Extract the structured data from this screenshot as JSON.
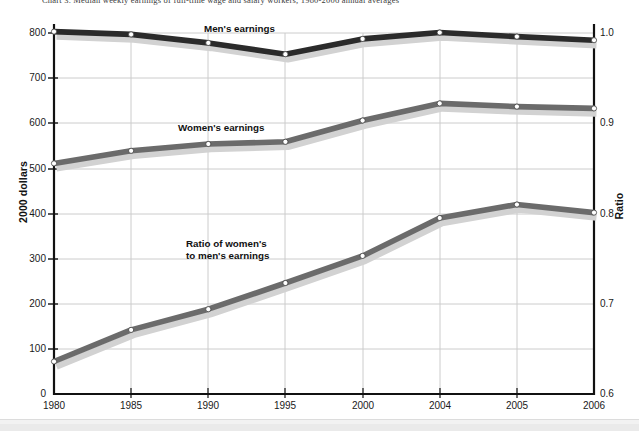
{
  "figure": {
    "title": "Chart 3.  Median weekly earnings of full-time wage and salary workers, 1980-2006 annual averages",
    "background_color": "#ffffff"
  },
  "axes": {
    "left": {
      "title": "2000 dollars",
      "ticks": [
        "0",
        "100",
        "200",
        "300",
        "400",
        "500",
        "600",
        "700",
        "800"
      ],
      "min": 0,
      "max": 800
    },
    "right": {
      "title": "Ratio",
      "ticks": [
        "0.6",
        "0.7",
        "0.8",
        "0.9",
        "1.0"
      ],
      "min": 0.6,
      "max": 1.0
    },
    "x": {
      "ticks": [
        "1980",
        "1985",
        "1990",
        "1995",
        "2000",
        "2004",
        "2005",
        "2006"
      ]
    }
  },
  "annotations": [
    {
      "name": "mens-earnings-label",
      "text": "Men's earnings"
    },
    {
      "name": "womens-earnings-label",
      "text": "Women's earnings"
    },
    {
      "name": "ratio-label-line1",
      "text": "Ratio of women's"
    },
    {
      "name": "ratio-label-line2",
      "text": "to men's earnings"
    }
  ],
  "colors": {
    "mens_line": "#2b2b2b",
    "womens_line": "#6b6b6b",
    "ratio_line": "#6b6b6b",
    "shadow": "#d2d2d2",
    "gridline": "#cccccc",
    "axis": "#111111",
    "marker_fill": "#ffffff"
  },
  "chart_data": {
    "type": "line",
    "title": "Chart 3.  Median weekly earnings of full-time wage and salary workers, 1980-2006 annual averages",
    "xlabel": "",
    "ylabel": "2000 dollars",
    "ylabel_secondary": "Ratio",
    "categories": [
      "1980",
      "1985",
      "1990",
      "1995",
      "2000",
      "2004",
      "2005",
      "2006"
    ],
    "ylim": [
      0,
      800
    ],
    "ylim_secondary": [
      0.6,
      1.0
    ],
    "grid": true,
    "legend": "inline-annotations",
    "series": [
      {
        "name": "Men's earnings",
        "axis": "left",
        "color": "#2b2b2b",
        "values": [
          803,
          797,
          778,
          753,
          787,
          801,
          792,
          784
        ]
      },
      {
        "name": "Women's earnings",
        "axis": "left",
        "color": "#6b6b6b",
        "values": [
          511,
          539,
          554,
          559,
          606,
          644,
          637,
          633
        ]
      },
      {
        "name": "Ratio of women's to men's earnings",
        "axis": "right",
        "color": "#6b6b6b",
        "values": [
          0.636,
          0.671,
          0.694,
          0.723,
          0.753,
          0.795,
          0.81,
          0.801
        ]
      }
    ]
  }
}
